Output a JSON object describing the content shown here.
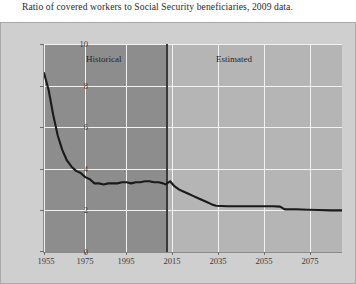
{
  "chart_data": {
    "type": "line",
    "title": "Ratio of covered workers to Social Security beneficiaries, 2009 data.",
    "xlabel": "",
    "ylabel": "Workers per beneficiary",
    "xlim": [
      1955,
      2085
    ],
    "ylim": [
      0,
      10
    ],
    "grid": true,
    "legend_position": "none",
    "xticks": [
      "1955",
      "1975",
      "1995",
      "2015",
      "2035",
      "2055",
      "2075"
    ],
    "xtick_values": [
      1955,
      1975,
      1995,
      2015,
      2035,
      2055,
      2075
    ],
    "yticks": [
      "0",
      "2",
      "4",
      "6",
      "8",
      "10"
    ],
    "ytick_values": [
      0,
      2,
      4,
      6,
      8,
      10
    ],
    "annotations": [
      {
        "text": "Historical",
        "x": 1972,
        "y": 9.3
      },
      {
        "text": "Estimated",
        "x": 2029,
        "y": 9.3
      }
    ],
    "regions": [
      {
        "label": "Historical",
        "x_start": 1955,
        "x_end": 2008,
        "color": "#8d8d8d"
      },
      {
        "label": "Estimated",
        "x_start": 2008,
        "x_end": 2085,
        "color": "#b5b5b5"
      }
    ],
    "divider_x": 2008,
    "series": [
      {
        "name": "Workers per beneficiary",
        "color": "#1a1a1a",
        "x": [
          1955,
          1957,
          1959,
          1961,
          1963,
          1965,
          1967,
          1969,
          1971,
          1973,
          1975,
          1977,
          1979,
          1981,
          1983,
          1985,
          1987,
          1989,
          1991,
          1993,
          1995,
          1997,
          1999,
          2001,
          2003,
          2005,
          2007,
          2008,
          2010,
          2012,
          2014,
          2016,
          2018,
          2020,
          2022,
          2024,
          2026,
          2028,
          2030,
          2035,
          2040,
          2045,
          2050,
          2055,
          2058,
          2060,
          2065,
          2070,
          2075,
          2080,
          2085
        ],
        "y": [
          8.6,
          7.8,
          6.6,
          5.6,
          4.9,
          4.4,
          4.1,
          3.9,
          3.8,
          3.6,
          3.5,
          3.3,
          3.3,
          3.25,
          3.3,
          3.3,
          3.3,
          3.35,
          3.35,
          3.3,
          3.35,
          3.35,
          3.4,
          3.4,
          3.35,
          3.35,
          3.3,
          3.25,
          3.4,
          3.15,
          3.0,
          2.9,
          2.8,
          2.7,
          2.6,
          2.5,
          2.4,
          2.3,
          2.22,
          2.2,
          2.2,
          2.2,
          2.2,
          2.2,
          2.18,
          2.05,
          2.05,
          2.03,
          2.02,
          2.0,
          2.0
        ]
      }
    ]
  },
  "colors": {
    "figure_background": "#cfcfcf",
    "historical_band": "#8d8d8d",
    "estimated_band": "#b5b5b5",
    "gridline": "#f2f2f2",
    "line": "#1a1a1a",
    "divider": "#3a3a3a",
    "text": "#2b2b2b"
  }
}
